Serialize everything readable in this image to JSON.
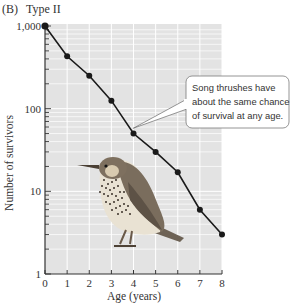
{
  "chart_data": {
    "type": "line",
    "panel_label": "(B)",
    "title": "Type II",
    "xlabel": "Age (years)",
    "ylabel": "Number of survivors",
    "yscale": "log",
    "xlim": [
      0,
      8
    ],
    "ylim": [
      1,
      1000
    ],
    "x_ticks": [
      0,
      1,
      2,
      3,
      4,
      5,
      6,
      7,
      8
    ],
    "x_tick_labels": [
      "0",
      "1",
      "2",
      "3",
      "4",
      "5",
      "6",
      "7",
      "8"
    ],
    "y_ticks": [
      1,
      10,
      100,
      1000
    ],
    "y_tick_labels": [
      "1",
      "10",
      "100",
      "1,000"
    ],
    "grid": true,
    "series": [
      {
        "name": "Song thrush",
        "x": [
          0,
          1,
          2,
          3,
          4,
          5,
          6,
          7,
          8
        ],
        "values": [
          1000,
          430,
          250,
          125,
          50,
          30,
          17,
          6,
          3
        ]
      }
    ],
    "annotation": {
      "text_lines": [
        "Song thrushes have",
        "about the same chance",
        "of survival at any age."
      ],
      "points_to_x": 3.9
    },
    "illustration": "song-thrush-bird"
  },
  "colors": {
    "plot_background": "#e3e3e3",
    "grid": "#ffffff",
    "line": "#1a1a1a",
    "axis": "#333333"
  }
}
